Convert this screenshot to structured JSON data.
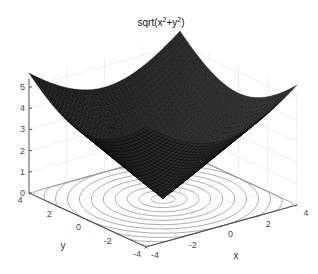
{
  "chart_data": {
    "type": "surface3d",
    "title_display": {
      "base": "sqrt(x",
      "sup1": "2",
      "mid": "+y",
      "sup2": "2",
      "end": ")"
    },
    "function": "z = sqrt(x^2 + y^2)",
    "xlabel": "x",
    "ylabel": "y",
    "zlabel": "",
    "xlim": [
      -4,
      4
    ],
    "ylim": [
      -4,
      4
    ],
    "zlim": [
      0,
      5.66
    ],
    "xticks": [
      -4,
      -2,
      0,
      2,
      4
    ],
    "yticks": [
      -4,
      -2,
      0,
      2,
      4
    ],
    "zticks": [
      0,
      1,
      2,
      3,
      4,
      5
    ],
    "grid": true,
    "surface_color": "#1a1a1a",
    "mesh_line_color": "#000000",
    "contour_on_floor": true,
    "contour_levels": [
      0.5,
      1,
      1.5,
      2,
      2.5,
      3,
      3.5,
      4,
      4.5,
      5,
      5.5
    ],
    "contour_color": "#9a9a9a",
    "legend": null
  }
}
